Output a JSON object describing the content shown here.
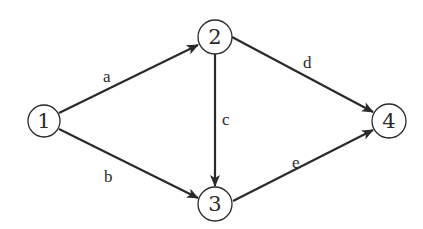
{
  "diagram": {
    "type": "directed-graph",
    "nodes": [
      {
        "id": "1",
        "label": "1",
        "x": 44,
        "y": 121
      },
      {
        "id": "2",
        "label": "2",
        "x": 215,
        "y": 37
      },
      {
        "id": "3",
        "label": "3",
        "x": 215,
        "y": 204
      },
      {
        "id": "4",
        "label": "4",
        "x": 389,
        "y": 121
      }
    ],
    "edges": [
      {
        "id": "a",
        "label": "a",
        "from": "1",
        "to": "2"
      },
      {
        "id": "b",
        "label": "b",
        "from": "1",
        "to": "3"
      },
      {
        "id": "c",
        "label": "c",
        "from": "2",
        "to": "3"
      },
      {
        "id": "d",
        "label": "d",
        "from": "2",
        "to": "4"
      },
      {
        "id": "e",
        "label": "e",
        "from": "3",
        "to": "4"
      }
    ],
    "colors": {
      "stroke": "#2a2a2a",
      "background": "#ffffff"
    }
  }
}
